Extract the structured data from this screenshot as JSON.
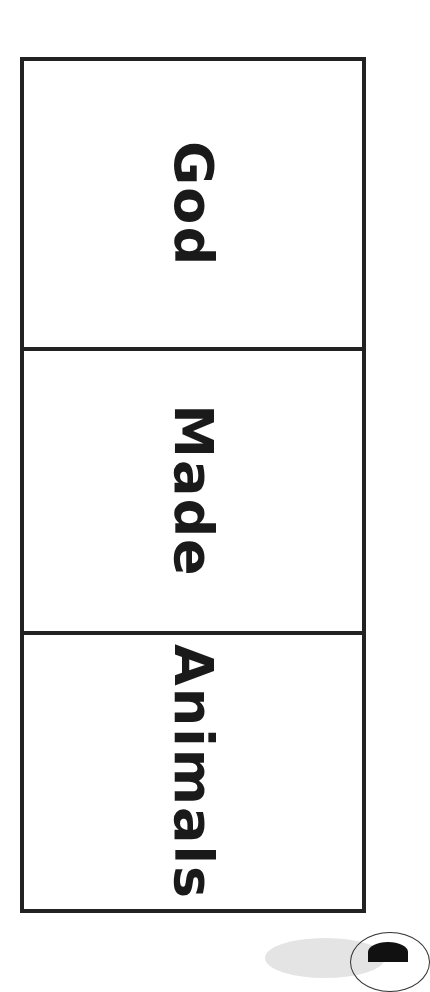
{
  "document": {
    "type": "printable foldable card",
    "panels": [
      {
        "word": "God"
      },
      {
        "word": "Made"
      },
      {
        "word": "Animals"
      }
    ],
    "colors": {
      "border": "#222222",
      "text": "#1a1a1a",
      "background": "#ffffff"
    },
    "text_orientation": "rotated 90deg clockwise"
  }
}
